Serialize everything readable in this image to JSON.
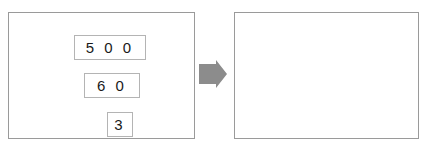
{
  "figure": {
    "title": "",
    "kind": "place-value regrouping illustration",
    "background_color": "#ffffff",
    "panel_border_color": "#9a9a9a",
    "box_border_color": "#b4b4b4",
    "digit_color": "#1a1a1a",
    "transition_arrow_color": "#8c8c8c",
    "carry_arrow_color": "#000000"
  },
  "panels": [
    {
      "id": "before",
      "name": "before-panel",
      "boxes": [
        {
          "id": "box-500",
          "value": "5 0 0",
          "cells": [
            "5 0 0"
          ],
          "place": "hundreds"
        },
        {
          "id": "box-60",
          "value": "6 0",
          "cells": [
            "6 0"
          ],
          "place": "tens"
        },
        {
          "id": "box-3",
          "value": "3",
          "cells": [
            "3"
          ],
          "place": "ones"
        }
      ],
      "carry_arrows": []
    },
    {
      "id": "after",
      "name": "after-panel",
      "boxes": [
        {
          "id": "box-560",
          "value": "5 6 0",
          "cells": [
            "5",
            "6 0"
          ],
          "place": "hundreds-tens",
          "divided": true
        },
        {
          "id": "box-3b",
          "value": "3",
          "cells": [
            "3"
          ],
          "place": "ones"
        }
      ],
      "carry_arrows": [
        {
          "id": "carry-arrow-short",
          "label": "",
          "direction": "up",
          "style": "dotted",
          "has_start_dot": true
        },
        {
          "id": "carry-arrow-long",
          "label": "",
          "direction": "up",
          "style": "dotted",
          "has_start_dot": true
        }
      ]
    }
  ],
  "transition": {
    "id": "transition-arrow",
    "label": "",
    "direction": "right",
    "shape": "block-arrow"
  }
}
